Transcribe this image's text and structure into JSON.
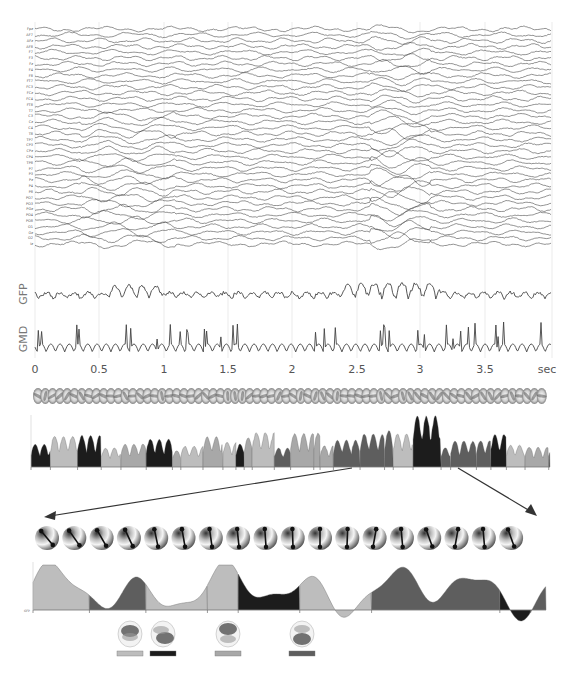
{
  "chart_data": [
    {
      "id": "eeg",
      "type": "line",
      "title": "",
      "description": "Multichannel EEG traces (stacked)",
      "channels": [
        "Fpz",
        "AF7",
        "AFz",
        "AF8",
        "F7",
        "F3",
        "Fz",
        "F4",
        "F8",
        "FT7",
        "FC3",
        "FCz",
        "FC4",
        "FT8",
        "T7",
        "C3",
        "Cz",
        "C4",
        "T8",
        "TP7",
        "CP3",
        "CPz",
        "CP4",
        "TP8",
        "P7",
        "P3",
        "Pz",
        "P4",
        "P8",
        "PO7",
        "PO3",
        "POz",
        "PO4",
        "PO8",
        "O1",
        "Oz",
        "O2",
        "Iz"
      ],
      "x_range": [
        0,
        4.0
      ],
      "xlabel": "sec"
    },
    {
      "id": "gfp",
      "type": "line",
      "ylabel": "GFP",
      "x_range": [
        0,
        4.0
      ],
      "peaks_note": "larger amplitude around 0.7–0.9 s and 2.5–3.1 s"
    },
    {
      "id": "gmd",
      "type": "line",
      "ylabel": "GMD",
      "x_range": [
        0,
        4.0
      ]
    },
    {
      "id": "time-axis",
      "type": "axis",
      "ticks": [
        "0",
        "0.5",
        "1",
        "1.5",
        "2",
        "2.5",
        "3",
        "3.5"
      ],
      "tick_values": [
        0,
        0.5,
        1,
        1.5,
        2,
        2.5,
        3,
        3.5
      ],
      "unit_label": "sec",
      "grid": true
    },
    {
      "id": "microstate-gfp",
      "type": "area",
      "description": "GFP segmented into microstate classes (4 gray levels)",
      "classes": [
        {
          "name": "A",
          "color": "#bdbdbd"
        },
        {
          "name": "B",
          "color": "#1c1c1c"
        },
        {
          "name": "C",
          "color": "#a8a8a8"
        },
        {
          "name": "D",
          "color": "#5e5e5e"
        }
      ]
    },
    {
      "id": "zoomed-segment",
      "type": "area",
      "ylabel": "GFP",
      "segments": [
        {
          "class": "A",
          "start": 0.0,
          "end": 0.11
        },
        {
          "class": "D",
          "start": 0.11,
          "end": 0.22
        },
        {
          "class": "A",
          "start": 0.22,
          "end": 0.34
        },
        {
          "class": "A",
          "start": 0.34,
          "end": 0.4
        },
        {
          "class": "B",
          "start": 0.4,
          "end": 0.52
        },
        {
          "class": "A",
          "start": 0.52,
          "end": 0.66
        },
        {
          "class": "D",
          "start": 0.66,
          "end": 0.91
        },
        {
          "class": "B",
          "start": 0.91,
          "end": 0.97
        },
        {
          "class": "D",
          "start": 0.97,
          "end": 1.0
        }
      ]
    }
  ],
  "labels": {
    "gfp": "GFP",
    "gmd": "GMD",
    "sec": "sec",
    "bottom_gfp": "GFP"
  },
  "axis": {
    "ticks": [
      {
        "label": "0",
        "x": 35
      },
      {
        "label": "0.5",
        "x": 99
      },
      {
        "label": "1",
        "x": 164
      },
      {
        "label": "1.5",
        "x": 228
      },
      {
        "label": "2",
        "x": 292
      },
      {
        "label": "2.5",
        "x": 357
      },
      {
        "label": "3",
        "x": 420
      },
      {
        "label": "3.5",
        "x": 485
      }
    ],
    "unit": "sec"
  },
  "legend_maps": [
    {
      "class": "A",
      "color": "#bdbdbd"
    },
    {
      "class": "B",
      "color": "#1c1c1c"
    },
    {
      "class": "C",
      "color": "#a8a8a8"
    },
    {
      "class": "D",
      "color": "#5e5e5e"
    }
  ],
  "colors": {
    "trace": "#3a3a3a",
    "grid": "#dddddd",
    "arrow": "#333333"
  }
}
